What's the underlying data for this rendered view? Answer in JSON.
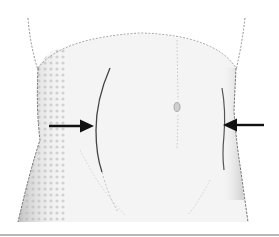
{
  "figure": {
    "arrows": [
      {
        "side": "left",
        "direction": "right"
      },
      {
        "side": "right",
        "direction": "left"
      }
    ],
    "colors": {
      "background": "#ffffff",
      "outline": "#555555",
      "shading": "#c8c8c8",
      "arrow": "#111111",
      "rule": "#b8b8b8"
    }
  }
}
